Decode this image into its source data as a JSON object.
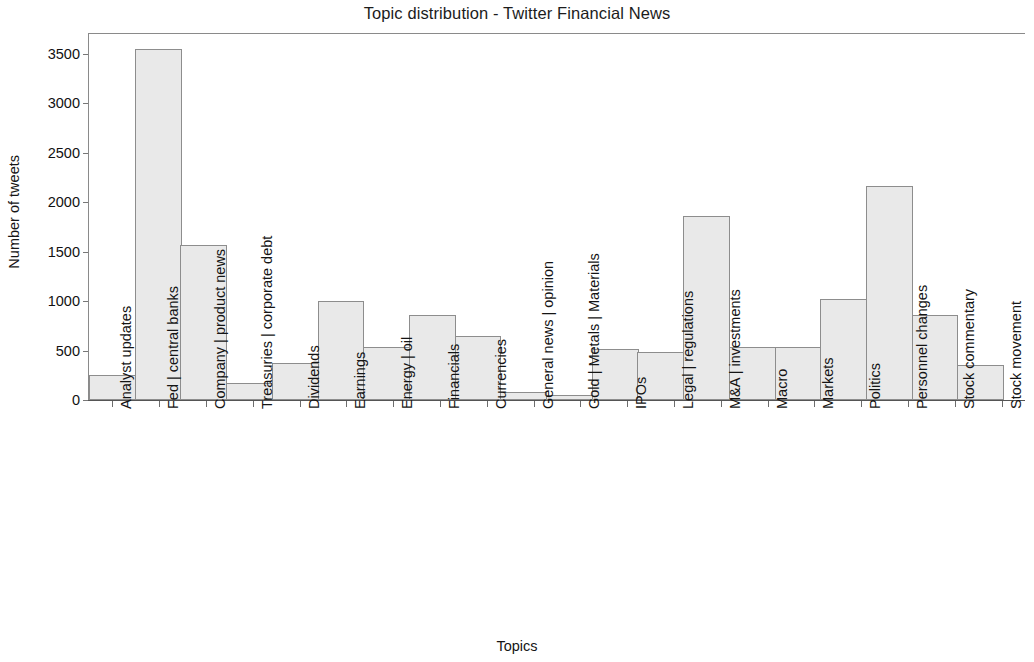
{
  "chart_data": {
    "type": "bar",
    "title": "Topic distribution - Twitter Financial News",
    "xlabel": "Topics",
    "ylabel": "Number of tweets",
    "ylim": [
      0,
      3700
    ],
    "yticks": [
      0,
      500,
      1000,
      1500,
      2000,
      2500,
      3000,
      3500
    ],
    "grid": false,
    "legend": null,
    "bar_style": {
      "fill": "#e9e9e9",
      "edge": "#8d8d8d",
      "gap": 0
    },
    "categories": [
      "Analyst updates",
      "Fed | central banks",
      "Company | product news",
      "Treasuries | corporate debt",
      "Dividends",
      "Earnings",
      "Energy | oil",
      "Financials",
      "Currencies",
      "General news | opinion",
      "Gold | Metals | Materials",
      "IPOs",
      "Legal | regulations",
      "M&A | investments",
      "Macro",
      "Markets",
      "Politics",
      "Personnel changes",
      "Stock commentary",
      "Stock movement"
    ],
    "values": [
      255,
      3550,
      1565,
      175,
      370,
      1005,
      540,
      855,
      645,
      85,
      55,
      520,
      490,
      1860,
      535,
      535,
      1020,
      2160,
      855,
      355
    ]
  }
}
